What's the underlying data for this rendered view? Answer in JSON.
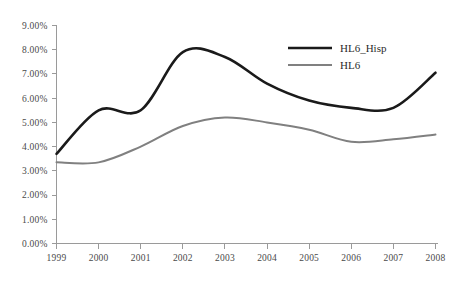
{
  "chart_data": {
    "type": "line",
    "title": "",
    "subtitle": "",
    "xlabel": "",
    "ylabel": "",
    "x": [
      1999,
      2000,
      2001,
      2002,
      2003,
      2004,
      2005,
      2006,
      2007,
      2008
    ],
    "categories": [
      "1999",
      "2000",
      "2001",
      "2002",
      "2003",
      "2004",
      "2005",
      "2006",
      "2007",
      "2008"
    ],
    "series": [
      {
        "name": "HL6_Hisp",
        "color": "#1a1a1a",
        "line_width": 2.6,
        "values": [
          3.7,
          5.5,
          5.5,
          7.9,
          7.7,
          6.6,
          5.9,
          5.6,
          5.6,
          7.05
        ]
      },
      {
        "name": "HL6",
        "color": "#808080",
        "line_width": 2.0,
        "values": [
          3.35,
          3.35,
          4.0,
          4.85,
          5.2,
          5.0,
          4.7,
          4.2,
          4.3,
          4.5
        ]
      }
    ],
    "ylim": [
      0,
      9
    ],
    "ytick_values": [
      0,
      1,
      2,
      3,
      4,
      5,
      6,
      7,
      8,
      9
    ],
    "ytick_labels": [
      "0.00%",
      "1.00%",
      "2.00%",
      "3.00%",
      "4.00%",
      "5.00%",
      "6.00%",
      "7.00%",
      "8.00%",
      "9.00%"
    ],
    "xtick_labels": [
      "1999",
      "2000",
      "2001",
      "2002",
      "2003",
      "2004",
      "2005",
      "2006",
      "2007",
      "2008"
    ],
    "grid": false,
    "markers": false,
    "smoothing": "spline",
    "legend_position": "top-right-inside",
    "legend": [
      {
        "label": "HL6_Hisp",
        "color": "#1a1a1a",
        "line_width": 2.6
      },
      {
        "label": "HL6",
        "color": "#808080",
        "line_width": 2.0
      }
    ],
    "axis_color": "#9a9a9a",
    "background_color": "#ffffff"
  }
}
